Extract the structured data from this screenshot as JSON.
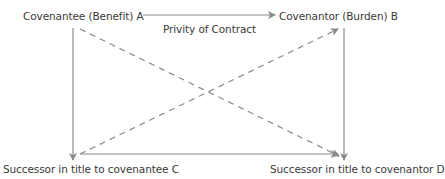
{
  "diagram": {
    "nodes": {
      "a": {
        "label": "Covenantee (Benefit) A"
      },
      "b": {
        "label": "Covenantor (Burden) B"
      },
      "c": {
        "label": "Successor in title to covenantee C"
      },
      "d": {
        "label": "Successor in title to covenantor D"
      }
    },
    "edges": {
      "a_to_b": {
        "label": "Privity of Contract",
        "style": "solid"
      },
      "a_to_c": {
        "style": "solid"
      },
      "b_to_d": {
        "style": "solid"
      },
      "c_to_d": {
        "style": "solid"
      },
      "a_to_d": {
        "style": "dashed"
      },
      "c_to_b": {
        "style": "dashed"
      }
    },
    "colors": {
      "line": "#8a8a8a",
      "text": "#3a3a3a",
      "background": "#ffffff"
    }
  }
}
